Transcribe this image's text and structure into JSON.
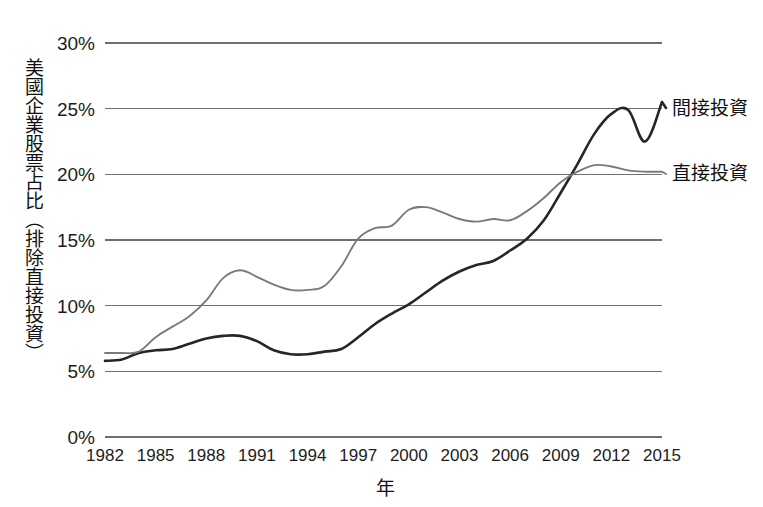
{
  "chart_data": {
    "type": "line",
    "title": "",
    "xlabel": "年",
    "ylabel": "美國企業股票占比（排除直接投資）",
    "xlim": [
      1982,
      2015
    ],
    "ylim": [
      0,
      30
    ],
    "grid": true,
    "legend_position": "right-of-plot-end-labels",
    "y_tick_labels": [
      "0%",
      "5%",
      "10%",
      "15%",
      "20%",
      "25%",
      "30%"
    ],
    "y_tick_values": [
      0,
      5,
      10,
      15,
      20,
      25,
      30
    ],
    "x_tick_labels": [
      "1982",
      "1985",
      "1988",
      "1991",
      "1994",
      "1997",
      "2000",
      "2003",
      "2006",
      "2009",
      "2012",
      "2015"
    ],
    "x_tick_values": [
      1982,
      1985,
      1988,
      1991,
      1994,
      1997,
      2000,
      2003,
      2006,
      2009,
      2012,
      2015
    ],
    "x": [
      1982,
      1983,
      1984,
      1985,
      1986,
      1987,
      1988,
      1989,
      1990,
      1991,
      1992,
      1993,
      1994,
      1995,
      1996,
      1997,
      1998,
      1999,
      2000,
      2001,
      2002,
      2003,
      2004,
      2005,
      2006,
      2007,
      2008,
      2009,
      2010,
      2011,
      2012,
      2013,
      2014,
      2015
    ],
    "series": [
      {
        "name": "間接投資",
        "color": "#262626",
        "width": 2.6,
        "end_value": 25.5,
        "values": [
          5.8,
          5.9,
          6.4,
          6.6,
          6.7,
          7.1,
          7.5,
          7.7,
          7.7,
          7.3,
          6.6,
          6.3,
          6.3,
          6.5,
          6.7,
          7.6,
          8.6,
          9.4,
          10.1,
          11.0,
          11.9,
          12.6,
          13.1,
          13.4,
          14.2,
          15.1,
          16.5,
          18.6,
          20.8,
          23.1,
          24.6,
          24.9,
          22.5,
          25.5
        ]
      },
      {
        "name": "直接投資",
        "color": "#7a7a7a",
        "width": 1.9,
        "end_value": 20.2,
        "values": [
          6.4,
          6.4,
          6.5,
          7.6,
          8.4,
          9.2,
          10.4,
          12.1,
          12.7,
          12.2,
          11.6,
          11.2,
          11.2,
          11.5,
          13.0,
          15.1,
          15.9,
          16.1,
          17.3,
          17.5,
          17.1,
          16.6,
          16.4,
          16.6,
          16.5,
          17.2,
          18.2,
          19.4,
          20.2,
          20.7,
          20.6,
          20.3,
          20.2,
          20.2
        ]
      }
    ]
  },
  "legend": {
    "indirect_label": "間接投資",
    "direct_label": "直接投資"
  },
  "axes": {
    "x_title": "年",
    "y_title": "美國企業股票占比（排除直接投資）"
  }
}
